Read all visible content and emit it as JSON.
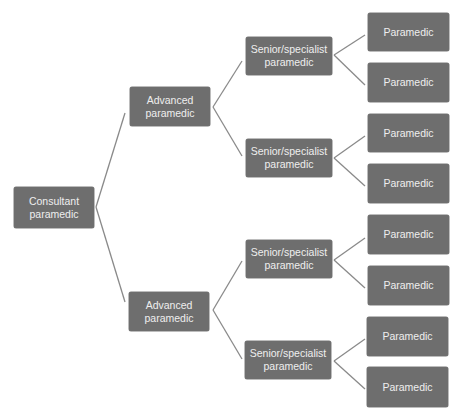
{
  "diagram": {
    "type": "hierarchy-tree",
    "direction": "left-to-right",
    "colors": {
      "node_fill": "#6e6e6e",
      "node_text": "#eeeeee",
      "connector": "#8a8a8a",
      "background": "#ffffff"
    },
    "root": {
      "label": "Consultant paramedic",
      "lines": [
        "Consultant",
        "paramedic"
      ]
    },
    "level1": [
      {
        "label": "Advanced paramedic",
        "lines": [
          "Advanced",
          "paramedic"
        ]
      },
      {
        "label": "Advanced paramedic",
        "lines": [
          "Advanced",
          "paramedic"
        ]
      }
    ],
    "level2": [
      {
        "label": "Senior/specialist paramedic",
        "lines": [
          "Senior/specialist",
          "paramedic"
        ]
      },
      {
        "label": "Senior/specialist paramedic",
        "lines": [
          "Senior/specialist",
          "paramedic"
        ]
      },
      {
        "label": "Senior/specialist paramedic",
        "lines": [
          "Senior/specialist",
          "paramedic"
        ]
      },
      {
        "label": "Senior/specialist paramedic",
        "lines": [
          "Senior/specialist",
          "paramedic"
        ]
      }
    ],
    "level3": [
      {
        "label": "Paramedic"
      },
      {
        "label": "Paramedic"
      },
      {
        "label": "Paramedic"
      },
      {
        "label": "Paramedic"
      },
      {
        "label": "Paramedic"
      },
      {
        "label": "Paramedic"
      },
      {
        "label": "Paramedic"
      },
      {
        "label": "Paramedic"
      }
    ]
  }
}
